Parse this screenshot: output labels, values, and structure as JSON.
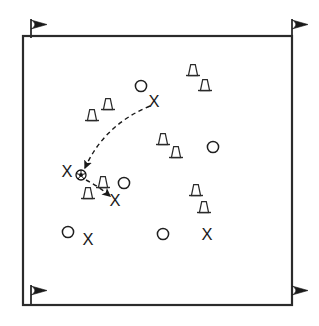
{
  "diagram": {
    "type": "sports-play-diagram",
    "background_color": "#ffffff",
    "line_color": "#2b2b2b",
    "field": {
      "name": "playing-area",
      "shape": "rectangle",
      "x": 23,
      "y": 36,
      "width": 269,
      "height": 269,
      "stroke_width": 2.2
    },
    "corner_flags": [
      {
        "name": "corner-flag-top-left",
        "pole_x": 31,
        "pole_top": 19,
        "pole_bottom": 38,
        "flag_dir": "right"
      },
      {
        "name": "corner-flag-top-right",
        "pole_x": 292,
        "pole_top": 19,
        "pole_bottom": 38,
        "flag_dir": "right"
      },
      {
        "name": "corner-flag-bottom-left",
        "pole_x": 31,
        "pole_top": 285,
        "pole_bottom": 305,
        "flag_dir": "right"
      },
      {
        "name": "corner-flag-bottom-right",
        "pole_x": 292,
        "pole_top": 285,
        "pole_bottom": 305,
        "flag_dir": "right"
      }
    ],
    "cones": [
      {
        "name": "cone-1",
        "x": 108,
        "y": 104
      },
      {
        "name": "cone-2",
        "x": 92,
        "y": 115
      },
      {
        "name": "cone-3",
        "x": 193,
        "y": 70
      },
      {
        "name": "cone-4",
        "x": 205,
        "y": 85
      },
      {
        "name": "cone-5",
        "x": 163,
        "y": 139
      },
      {
        "name": "cone-6",
        "x": 176,
        "y": 152
      },
      {
        "name": "cone-7",
        "x": 196,
        "y": 190
      },
      {
        "name": "cone-8",
        "x": 204,
        "y": 207
      },
      {
        "name": "cone-9",
        "x": 103,
        "y": 182
      },
      {
        "name": "cone-10",
        "x": 88,
        "y": 193
      }
    ],
    "attackers": [
      {
        "name": "player-o-1",
        "label": "O",
        "x": 141,
        "y": 86
      },
      {
        "name": "player-o-2",
        "label": "O",
        "x": 213,
        "y": 147
      },
      {
        "name": "player-o-3",
        "label": "O",
        "x": 124,
        "y": 183
      },
      {
        "name": "player-o-4",
        "label": "O",
        "x": 68,
        "y": 232
      },
      {
        "name": "player-o-5",
        "label": "O",
        "x": 163,
        "y": 234
      }
    ],
    "defenders": [
      {
        "name": "player-x-1",
        "label": "X",
        "x": 154,
        "y": 101
      },
      {
        "name": "player-x-2",
        "label": "X",
        "x": 67,
        "y": 171
      },
      {
        "name": "player-x-3",
        "label": "X",
        "x": 115,
        "y": 200
      },
      {
        "name": "player-x-4",
        "label": "X",
        "x": 88,
        "y": 239
      },
      {
        "name": "player-x-5",
        "label": "X",
        "x": 207,
        "y": 234
      }
    ],
    "ball": {
      "name": "soccer-ball",
      "x": 81,
      "y": 175,
      "radius": 5
    },
    "movement_paths": [
      {
        "name": "pass-path-long",
        "style": "dashed",
        "from_x": 150,
        "from_y": 106,
        "ctrl_x": 104,
        "ctrl_y": 125,
        "to_x": 85,
        "to_y": 168,
        "arrowhead": "end"
      },
      {
        "name": "pass-path-short",
        "style": "dashed",
        "from_x": 86,
        "from_y": 180,
        "ctrl_x": 98,
        "ctrl_y": 186,
        "to_x": 110,
        "to_y": 196,
        "arrowhead": "end"
      }
    ],
    "legend_visible": false
  }
}
